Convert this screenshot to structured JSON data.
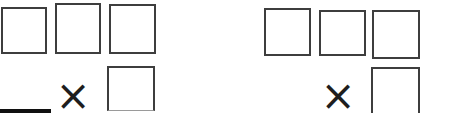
{
  "colors": {
    "background": "#ffffff",
    "box_border": "#3e3e3e",
    "operator": "#1e1e1e",
    "faded_bottom_edge": "#9a9a9a",
    "scan_mark": "#101010"
  },
  "problems": [
    {
      "operator": "×",
      "top_box_count": 3,
      "bottom_box_count": 1
    },
    {
      "operator": "×",
      "top_box_count": 3,
      "bottom_box_count": 1
    }
  ]
}
